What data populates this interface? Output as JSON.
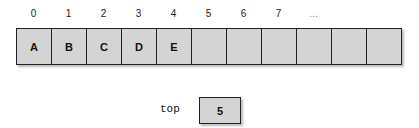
{
  "diagram": {
    "indices": [
      "0",
      "1",
      "2",
      "3",
      "4",
      "5",
      "6",
      "7",
      "..."
    ],
    "cells": [
      "A",
      "B",
      "C",
      "D",
      "E",
      "",
      "",
      "",
      "",
      "",
      ""
    ],
    "top": {
      "label": "top",
      "value": "5"
    }
  }
}
